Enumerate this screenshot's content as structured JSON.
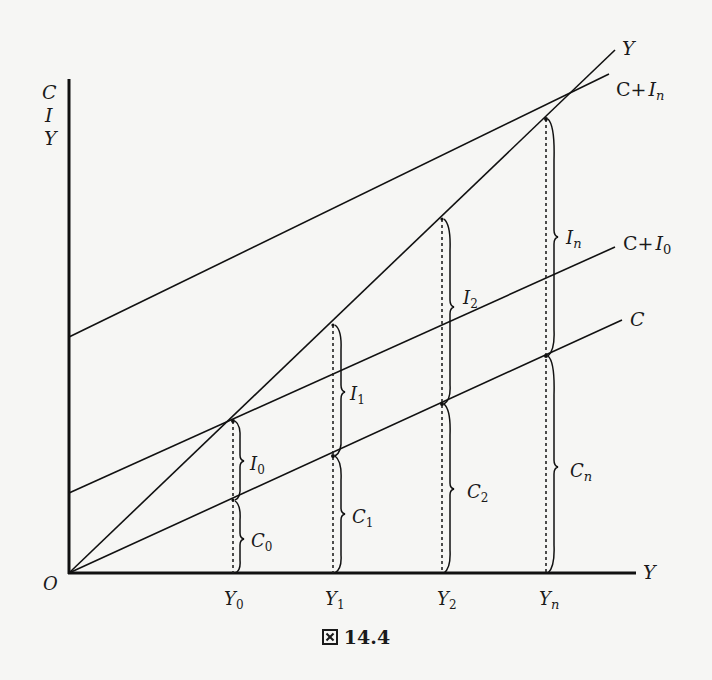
{
  "figure": {
    "caption_prefix": "図",
    "caption_number": "14.4",
    "y_axis_labels": [
      "C",
      "I",
      "Y"
    ],
    "x_axis_label": "Y",
    "origin_label": "O",
    "lines": {
      "y45": "Y",
      "c_plus_in": "C+",
      "c_plus_in_sub": "n",
      "c_plus_i0": "C+",
      "c_plus_i0_sub": "0",
      "c": "C"
    },
    "x_ticks": [
      {
        "base": "Y",
        "sub": "0"
      },
      {
        "base": "Y",
        "sub": "1"
      },
      {
        "base": "Y",
        "sub": "2"
      },
      {
        "base": "Y",
        "sub": "n"
      }
    ],
    "brace_labels": {
      "I0": {
        "base": "I",
        "sub": "0"
      },
      "C0": {
        "base": "C",
        "sub": "0"
      },
      "I1": {
        "base": "I",
        "sub": "1"
      },
      "C1": {
        "base": "C",
        "sub": "1"
      },
      "I2": {
        "base": "I",
        "sub": "2"
      },
      "C2": {
        "base": "C",
        "sub": "2"
      },
      "In": {
        "base": "I",
        "sub": "n"
      },
      "Cn": {
        "base": "C",
        "sub": "n"
      }
    }
  }
}
